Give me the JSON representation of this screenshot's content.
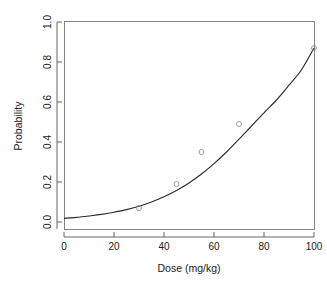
{
  "chart_data": {
    "type": "scatter",
    "title": "",
    "subtitle": "",
    "xlabel": "Dose (mg/kg)",
    "ylabel": "Probability",
    "xlim": [
      0,
      104
    ],
    "ylim": [
      0,
      1.04
    ],
    "grid": false,
    "legend": false,
    "x_ticks": [
      0,
      20,
      40,
      60,
      80,
      100
    ],
    "x_tick_labels": [
      "0",
      "20",
      "40",
      "60",
      "80",
      "100"
    ],
    "y_ticks": [
      0.0,
      0.2,
      0.4,
      0.6,
      0.8,
      1.0
    ],
    "y_tick_labels": [
      "0.0",
      "0.2",
      "0.4",
      "0.6",
      "0.8",
      "1.0"
    ],
    "series": [
      {
        "name": "Observed proportions",
        "marker": "open-circle",
        "color": "#8a8a8a",
        "x": [
          30,
          45,
          55,
          70,
          100
        ],
        "y": [
          0.07,
          0.19,
          0.35,
          0.49,
          0.87
        ]
      },
      {
        "name": "Fitted logistic curve",
        "marker": "none",
        "color": "#2b2b2b",
        "x": [
          0,
          5,
          10,
          15,
          20,
          25,
          30,
          35,
          40,
          45,
          50,
          55,
          60,
          65,
          70,
          75,
          80,
          85,
          90,
          95,
          100
        ],
        "y": [
          0.018,
          0.023,
          0.03,
          0.038,
          0.049,
          0.062,
          0.079,
          0.1,
          0.126,
          0.157,
          0.195,
          0.24,
          0.292,
          0.35,
          0.414,
          0.48,
          0.546,
          0.61,
          0.684,
          0.761,
          0.87
        ]
      }
    ]
  },
  "figure": {
    "background_color": "#ffffff",
    "axis_color": "#555555",
    "panel_border_color": "#777777",
    "text_color": "#1a1a1a"
  }
}
